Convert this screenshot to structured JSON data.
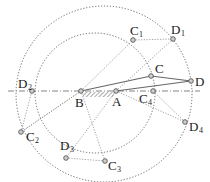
{
  "diagram": {
    "title": "",
    "type": "four-bar linkage kinematic construction",
    "colors": {
      "line": "#555555",
      "dotted": "#666666",
      "point_fill": "#bbbbbb",
      "text": "#222222"
    },
    "labels": {
      "B": "B",
      "A": "A",
      "C": "C",
      "D": "D",
      "C1": "C",
      "C1_sub": "1",
      "D1": "D",
      "D1_sub": "1",
      "C2": "C",
      "C2_sub": "2",
      "D2": "D",
      "D2_sub": "2",
      "C3": "C",
      "C3_sub": "3",
      "D3": "D",
      "D3_sub": "3",
      "C4": "C",
      "C4_sub": "4",
      "D4": "D",
      "D4_sub": "4"
    },
    "points": {
      "B": [
        81,
        91
      ],
      "A": [
        116,
        91
      ],
      "C": [
        151,
        76
      ],
      "D": [
        191,
        81
      ],
      "C1": [
        133,
        40
      ],
      "D1": [
        173,
        39
      ],
      "C2": [
        21,
        132
      ],
      "D2": [
        32,
        91
      ],
      "C3": [
        105,
        161
      ],
      "D3": [
        66,
        158
      ],
      "C4": [
        153,
        91
      ],
      "D4": [
        185,
        122
      ]
    },
    "circles": [
      {
        "name": "inner-circle",
        "cx": 95,
        "cy": 93,
        "r": 60
      },
      {
        "name": "outer-circle",
        "cx": 104,
        "cy": 94,
        "r": 88
      }
    ],
    "axis": {
      "y": 91,
      "x1": 8,
      "x2": 200
    }
  }
}
